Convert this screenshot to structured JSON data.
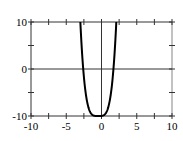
{
  "chart_data": {
    "type": "line",
    "title": "",
    "xlabel": "",
    "ylabel": "",
    "xlim": [
      -10,
      10
    ],
    "ylim": [
      -10,
      10
    ],
    "x_ticks": [
      -10,
      -5,
      0,
      5,
      10
    ],
    "x_tick_labels": [
      "-10",
      "-5",
      "0",
      "5",
      "10"
    ],
    "y_ticks": [
      -10,
      0,
      10
    ],
    "y_tick_labels": [
      "-10",
      "0",
      "10"
    ],
    "minor_x_ticks": [
      -7.5,
      -2.5,
      2.5,
      7.5
    ],
    "minor_y_ticks": [
      -5,
      5
    ],
    "grid": false,
    "axes_lines": {
      "x_zero": true,
      "y_zero": true
    },
    "series": [
      {
        "name": "curve",
        "description": "quartic-like U curve, clipped to y in [-10,10], flat bottom near y=-10 around x in [-1,0]",
        "x": [
          -3.0,
          -2.6,
          -2.2,
          -1.8,
          -1.4,
          -1.0,
          -0.45,
          0.1,
          0.5,
          0.9,
          1.3,
          1.7,
          2.1
        ],
        "y": [
          10,
          0.0,
          -6.2,
          -8.7,
          -9.6,
          -9.95,
          -10,
          -9.95,
          -9.6,
          -8.7,
          -6.2,
          0.0,
          10
        ],
        "color": "#000000"
      }
    ]
  }
}
